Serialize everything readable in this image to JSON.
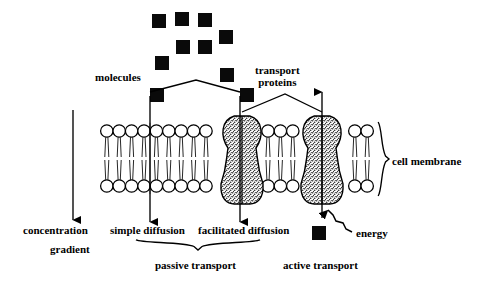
{
  "diagram": {
    "colors": {
      "ink": "#000000",
      "background": "#ffffff",
      "molecule_fill": "#0a0a0a",
      "protein_stipple": "#3a3a3a"
    }
  },
  "labels": {
    "molecules": "molecules",
    "transport_proteins_line1": "transport",
    "transport_proteins_line2": "proteins",
    "cell_membrane": "cell membrane",
    "concentration_line1": "concentration",
    "concentration_line2": "gradient",
    "simple_diffusion": "simple diffusion",
    "facilitated_diffusion": "facilitated diffusion",
    "energy": "energy",
    "passive_transport": "passive transport",
    "active_transport": "active transport"
  },
  "molecules": {
    "size": 14,
    "free_cluster": [
      {
        "x": 152,
        "y": 14
      },
      {
        "x": 175,
        "y": 12
      },
      {
        "x": 198,
        "y": 13
      },
      {
        "x": 219,
        "y": 30
      },
      {
        "x": 176,
        "y": 40
      },
      {
        "x": 198,
        "y": 40
      },
      {
        "x": 155,
        "y": 56
      },
      {
        "x": 220,
        "y": 68
      }
    ],
    "labelled_left": {
      "x": 150,
      "y": 88
    },
    "labelled_right": {
      "x": 240,
      "y": 88
    },
    "energy_molecule": {
      "x": 312,
      "y": 226
    }
  },
  "membrane": {
    "left": 100,
    "right": 376,
    "top_head_center_y": 131,
    "bottom_head_center_y": 186,
    "head_radius": 6.2,
    "head_spacing": 12.4,
    "heads_top_count": 22,
    "heads_bottom_count": 22
  },
  "proteins": [
    {
      "name": "facilitated-diffusion-protein",
      "center_x": 242,
      "top": 116,
      "bottom": 204,
      "waist_half_width": 14,
      "bell_half_width": 21
    },
    {
      "name": "active-transport-protein",
      "center_x": 322,
      "top": 116,
      "bottom": 204,
      "waist_half_width": 14,
      "bell_half_width": 21
    }
  ],
  "arrows": [
    {
      "name": "concentration-gradient-arrow",
      "x": 73,
      "y_from": 110,
      "y_to": 220,
      "direction": "down"
    },
    {
      "name": "simple-diffusion-arrow",
      "x": 150,
      "y_from": 96,
      "y_to": 222,
      "direction": "down"
    },
    {
      "name": "facilitated-diffusion-arrow",
      "x": 240,
      "y_from": 96,
      "y_to": 222,
      "direction": "down"
    },
    {
      "name": "active-transport-arrow",
      "x": 322,
      "y_from": 218,
      "y_to": 92,
      "direction": "up"
    },
    {
      "name": "energy-arrow",
      "x_from": 352,
      "y_from": 232,
      "x_to": 326,
      "y_to": 208,
      "direction": "zigzag-up-left"
    }
  ],
  "connectors": [
    {
      "name": "molecules-connector",
      "left_x": 150,
      "apex_x": 196,
      "right_x": 240,
      "apex_y": 80,
      "end_y": 92
    },
    {
      "name": "transport-proteins-connector",
      "left_x": 242,
      "apex_x": 285,
      "right_x": 322,
      "apex_y": 94,
      "end_y": 112
    }
  ],
  "braces": [
    {
      "name": "cell-membrane-brace",
      "orientation": "vertical",
      "x": 382,
      "y_top": 122,
      "y_bottom": 196
    },
    {
      "name": "passive-transport-brace",
      "orientation": "horizontal",
      "y": 243,
      "x_left": 136,
      "x_right": 260
    }
  ],
  "label_positions": {
    "molecules": {
      "x": 95,
      "y": 71
    },
    "transport_proteins": {
      "x": 255,
      "y": 64
    },
    "cell_membrane": {
      "x": 392,
      "y": 155
    },
    "concentration": {
      "x": 23,
      "y": 224
    },
    "gradient": {
      "x": 50,
      "y": 243
    },
    "simple_diffusion": {
      "x": 110,
      "y": 224
    },
    "facilitated_diffusion": {
      "x": 198,
      "y": 224
    },
    "energy": {
      "x": 356,
      "y": 227
    },
    "passive_transport": {
      "x": 155,
      "y": 259
    },
    "active_transport": {
      "x": 283,
      "y": 259
    }
  }
}
